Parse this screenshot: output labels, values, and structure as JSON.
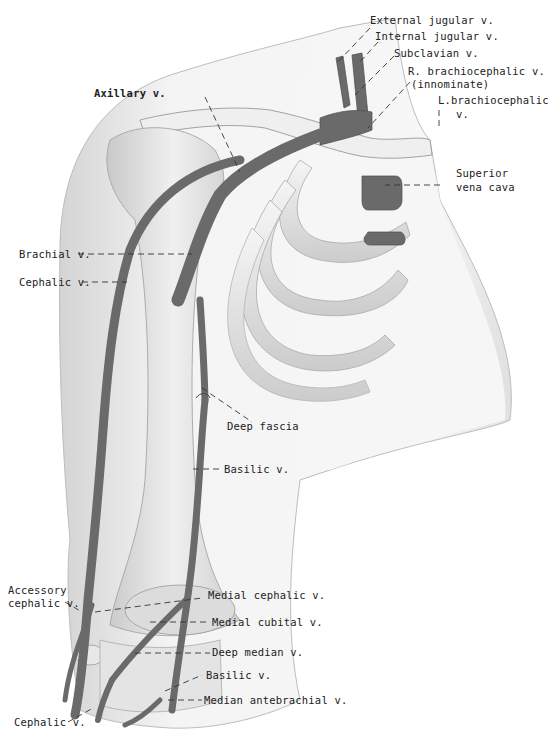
{
  "figure": {
    "colors": {
      "vein": "#6a6a6a",
      "vein_dark": "#555555",
      "bone_fill": "#ececec",
      "bone_shade": "#cfcfcf",
      "skin_fill": "#f3f3f3",
      "skin_edge": "#bdbdbd",
      "leader_line": "#333333",
      "text": "#222222"
    }
  },
  "labels": {
    "external_jugular": "External jugular v.",
    "internal_jugular": "Internal jugular v.",
    "subclavian": "Subclavian v.",
    "r_brachiocephalic_1": "R. brachiocephalic v.",
    "r_brachiocephalic_2": "(innominate)",
    "l_brachiocephalic_1": "L.brachiocephalic",
    "l_brachiocephalic_2": "v.",
    "axillary": "Axillary v.",
    "superior_vena_cava_1": "Superior",
    "superior_vena_cava_2": "vena cava",
    "brachial": "Brachial v.",
    "cephalic_upper": "Cephalic v.",
    "deep_fascia": "Deep fascia",
    "basilic_upper": "Basilic v.",
    "accessory_cephalic_1": "Accessory",
    "accessory_cephalic_2": "cephalic v.",
    "medial_cephalic": "Medial cephalic v.",
    "medial_cubital": "Medial cubital v.",
    "deep_median": "Deep median v.",
    "basilic_lower": "Basilic v.",
    "median_antebrachial": "Median antebrachial v.",
    "cephalic_lower": "Cephalic v."
  }
}
